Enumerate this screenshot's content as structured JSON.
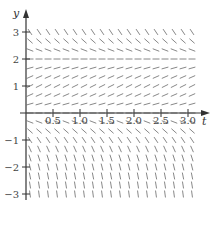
{
  "figure": {
    "type": "slope_field",
    "equation_hint": "dy/dt = y(2 - y)",
    "x_axis": {
      "label": "t",
      "range": [
        0,
        3.0
      ],
      "ticks": [
        0.5,
        1.0,
        1.5,
        2.0,
        2.5,
        3.0
      ],
      "tick_labels": [
        "0.5",
        "1.0",
        "1.5",
        "2.0",
        "2.5",
        "3.0"
      ]
    },
    "y_axis": {
      "label": "y",
      "range": [
        -3,
        3
      ],
      "ticks": [
        3,
        2,
        1,
        -1,
        -2,
        -3
      ],
      "tick_labels": [
        "3",
        "2",
        "1",
        "−1",
        "−2",
        "−3"
      ]
    },
    "equilibria": [
      0,
      2
    ],
    "grid": {
      "t_step": 0.1667,
      "y_step": 0.3333
    }
  },
  "colors": {
    "axis": "#333333",
    "marks": "#888888",
    "text": "#444444"
  }
}
